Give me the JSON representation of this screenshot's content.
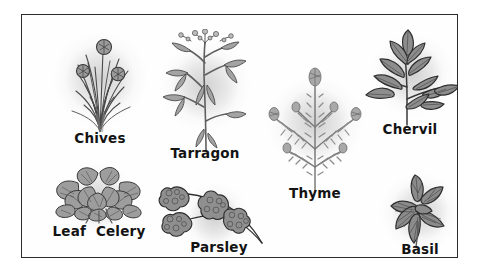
{
  "poster": {
    "background_color": "#fefefe",
    "border_color": "#2b2b2b",
    "outer_background": "#ffffff"
  },
  "style": {
    "ink_color": "#131313",
    "leaf_fill": "#8f8f8f",
    "leaf_fill_light": "#b4b4b4",
    "stem_color": "#6d6d6d",
    "halo_color": "#c4c4c4"
  },
  "herbs": [
    {
      "id": "chives",
      "label": "Chives",
      "icon": "chives-plant-icon",
      "caption_font_size": "13.5px",
      "description": "Dense clump of upright hollow blades with three round pompom flower heads",
      "box": {
        "left": 18,
        "top": 12,
        "width": 120,
        "height": 128
      },
      "halo": {
        "width": 96,
        "height": 96,
        "offset_x": 0,
        "offset_y": -12
      },
      "caption_top": 105
    },
    {
      "id": "tarragon",
      "label": "Tarragon",
      "icon": "tarragon-plant-icon",
      "caption_font_size": "13.5px",
      "description": "Tall upright stem with slender lance leaves and small flower sprays at the tip",
      "box": {
        "left": 122,
        "top": 14,
        "width": 122,
        "height": 142
      },
      "halo": {
        "width": 92,
        "height": 104,
        "offset_x": 0,
        "offset_y": -14
      },
      "caption_top": 118
    },
    {
      "id": "thyme",
      "label": "Thyme",
      "icon": "thyme-plant-icon",
      "caption_font_size": "13.5px",
      "description": "Fan of thin branching stems covered in tiny paired leaves with flower tufts",
      "box": {
        "left": 232,
        "top": 48,
        "width": 122,
        "height": 148
      },
      "halo": {
        "width": 96,
        "height": 104,
        "offset_x": 0,
        "offset_y": -14
      },
      "caption_top": 124
    },
    {
      "id": "chervil",
      "label": "Chervil",
      "icon": "chervil-plant-icon",
      "caption_font_size": "13.5px",
      "description": "Compound pinnate leaves with deeply lobed toothed leaflets",
      "box": {
        "left": 330,
        "top": 12,
        "width": 116,
        "height": 120
      },
      "halo": {
        "width": 92,
        "height": 84,
        "offset_x": 2,
        "offset_y": -12
      },
      "caption_top": 96
    },
    {
      "id": "leaf-celery",
      "label": "Leaf  Celery",
      "icon": "leaf-celery-plant-icon",
      "caption_font_size": "13.5px",
      "description": "Low bushy cluster of ruffled celery leaves on short stalks",
      "box": {
        "left": 12,
        "top": 148,
        "width": 130,
        "height": 92
      },
      "halo": {
        "width": 98,
        "height": 74,
        "offset_x": 0,
        "offset_y": -10
      },
      "caption_top": 62
    },
    {
      "id": "parsley",
      "label": "Parsley",
      "icon": "parsley-plant-icon",
      "caption_font_size": "13.5px",
      "description": "Three curly crinkled leaf clusters on long arching stems",
      "box": {
        "left": 136,
        "top": 168,
        "width": 122,
        "height": 92
      },
      "halo": {
        "width": 88,
        "height": 70,
        "offset_x": -4,
        "offset_y": -12
      },
      "caption_top": 58
    },
    {
      "id": "basil",
      "label": "Basil",
      "icon": "basil-plant-icon",
      "caption_font_size": "13.5px",
      "description": "Rosette of broad pointed leaves radiating from a central bud",
      "box": {
        "left": 340,
        "top": 158,
        "width": 116,
        "height": 102
      },
      "halo": {
        "width": 82,
        "height": 80,
        "offset_x": 0,
        "offset_y": -12
      },
      "caption_top": 70
    }
  ]
}
